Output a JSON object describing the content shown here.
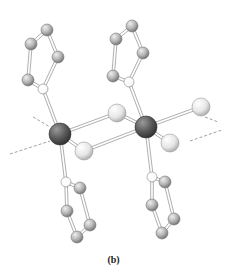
{
  "figure": {
    "caption": "(b)",
    "colors": {
      "metal": "#5a5a5a",
      "halide": "#e6e6e6",
      "carbon": "#b4b4b4",
      "nitrogen": "#ffffff",
      "bond": "#9a9a9a",
      "dashed_line": "#8a8a8a"
    },
    "atoms": [
      {
        "id": "M1",
        "type": "metal",
        "x": 60,
        "y": 134,
        "r": 11
      },
      {
        "id": "M2",
        "type": "metal",
        "x": 146,
        "y": 127,
        "r": 11
      },
      {
        "id": "X1",
        "type": "halide",
        "x": 117,
        "y": 113,
        "r": 9
      },
      {
        "id": "X2",
        "type": "halide",
        "x": 84,
        "y": 151,
        "r": 9
      },
      {
        "id": "X3",
        "type": "halide",
        "x": 201,
        "y": 107,
        "r": 9
      },
      {
        "id": "X4",
        "type": "halide",
        "x": 170,
        "y": 143,
        "r": 9
      },
      {
        "id": "N1",
        "type": "nitrogen",
        "x": 43,
        "y": 89,
        "r": 5
      },
      {
        "id": "C1a",
        "type": "carbon",
        "x": 28,
        "y": 80,
        "r": 6
      },
      {
        "id": "C1b",
        "type": "carbon",
        "x": 31,
        "y": 44,
        "r": 6
      },
      {
        "id": "C1c",
        "type": "carbon",
        "x": 47,
        "y": 30,
        "r": 6
      },
      {
        "id": "C1d",
        "type": "carbon",
        "x": 58,
        "y": 57,
        "r": 6
      },
      {
        "id": "N2",
        "type": "nitrogen",
        "x": 129,
        "y": 82,
        "r": 5
      },
      {
        "id": "C2a",
        "type": "carbon",
        "x": 113,
        "y": 76,
        "r": 6
      },
      {
        "id": "C2b",
        "type": "carbon",
        "x": 116,
        "y": 39,
        "r": 6
      },
      {
        "id": "C2c",
        "type": "carbon",
        "x": 132,
        "y": 26,
        "r": 6
      },
      {
        "id": "C2d",
        "type": "carbon",
        "x": 143,
        "y": 53,
        "r": 6
      },
      {
        "id": "N3",
        "type": "nitrogen",
        "x": 66,
        "y": 182,
        "r": 5
      },
      {
        "id": "C3a",
        "type": "carbon",
        "x": 80,
        "y": 188,
        "r": 6
      },
      {
        "id": "C3b",
        "type": "carbon",
        "x": 67,
        "y": 211,
        "r": 6
      },
      {
        "id": "C3c",
        "type": "carbon",
        "x": 90,
        "y": 225,
        "r": 6
      },
      {
        "id": "C3d",
        "type": "carbon",
        "x": 77,
        "y": 237,
        "r": 6
      },
      {
        "id": "N4",
        "type": "nitrogen",
        "x": 152,
        "y": 177,
        "r": 5
      },
      {
        "id": "C4a",
        "type": "carbon",
        "x": 165,
        "y": 182,
        "r": 6
      },
      {
        "id": "C4b",
        "type": "carbon",
        "x": 152,
        "y": 205,
        "r": 6
      },
      {
        "id": "C4c",
        "type": "carbon",
        "x": 174,
        "y": 219,
        "r": 6
      },
      {
        "id": "C4d",
        "type": "carbon",
        "x": 162,
        "y": 233,
        "r": 6
      }
    ],
    "bonds": [
      [
        "M1",
        "X1"
      ],
      [
        "M1",
        "X2"
      ],
      [
        "M2",
        "X1"
      ],
      [
        "M2",
        "X2"
      ],
      [
        "M2",
        "X3"
      ],
      [
        "M2",
        "X4"
      ],
      [
        "M1",
        "N1"
      ],
      [
        "M2",
        "N2"
      ],
      [
        "M1",
        "N3"
      ],
      [
        "M2",
        "N4"
      ],
      [
        "N1",
        "C1a"
      ],
      [
        "C1a",
        "C1b"
      ],
      [
        "C1b",
        "C1c"
      ],
      [
        "C1c",
        "C1d"
      ],
      [
        "C1d",
        "N1"
      ],
      [
        "N2",
        "C2a"
      ],
      [
        "C2a",
        "C2b"
      ],
      [
        "C2b",
        "C2c"
      ],
      [
        "C2c",
        "C2d"
      ],
      [
        "C2d",
        "N2"
      ],
      [
        "N3",
        "C3a"
      ],
      [
        "N3",
        "C3b"
      ],
      [
        "C3b",
        "C3d"
      ],
      [
        "C3a",
        "C3c"
      ],
      [
        "C3c",
        "C3d"
      ],
      [
        "N4",
        "C4a"
      ],
      [
        "N4",
        "C4b"
      ],
      [
        "C4b",
        "C4d"
      ],
      [
        "C4a",
        "C4c"
      ],
      [
        "C4c",
        "C4d"
      ]
    ],
    "dashed_lines": [
      {
        "x1": 33,
        "y1": 117,
        "x2": 50,
        "y2": 127
      },
      {
        "x1": 10,
        "y1": 154,
        "x2": 50,
        "y2": 141
      },
      {
        "x1": 190,
        "y1": 141,
        "x2": 222,
        "y2": 130
      },
      {
        "x1": 205,
        "y1": 117,
        "x2": 218,
        "y2": 122
      }
    ]
  }
}
